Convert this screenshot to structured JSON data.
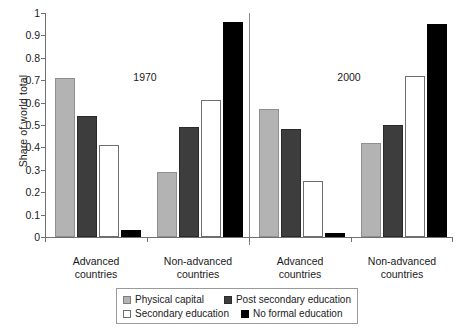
{
  "chart_data": {
    "type": "bar",
    "title": "",
    "xlabel": "",
    "ylabel": "Share of world total",
    "ylim": [
      0,
      1
    ],
    "ytick_labels": [
      "1",
      "0.9",
      "0.8",
      "0.7",
      "0.6",
      "0.5",
      "0.4",
      "0.3",
      "0.2",
      "0.1",
      "0"
    ],
    "ytick_values": [
      1,
      0.9,
      0.8,
      0.7,
      0.6,
      0.5,
      0.4,
      0.3,
      0.2,
      0.1,
      0
    ],
    "grid": false,
    "legend_position": "bottom-center",
    "panels": [
      {
        "label": "1970"
      },
      {
        "label": "2000"
      }
    ],
    "categories": [
      "Advanced countries",
      "Non-advanced countries",
      "Advanced countries",
      "Non-advanced countries"
    ],
    "series": [
      {
        "name": "Physical capital",
        "color": "#b3b3b3",
        "values": [
          0.71,
          0.29,
          0.57,
          0.42
        ]
      },
      {
        "name": "Post secondary education",
        "color": "#3d3d3d",
        "values": [
          0.54,
          0.49,
          0.48,
          0.5
        ]
      },
      {
        "name": "Secondary education",
        "color": "#ffffff",
        "values": [
          0.41,
          0.61,
          0.25,
          0.72
        ]
      },
      {
        "name": "No formal education",
        "color": "#000000",
        "values": [
          0.03,
          0.96,
          0.02,
          0.95
        ]
      }
    ]
  },
  "axis": {
    "y_title": "Share of world total",
    "ticks": [
      "1",
      "0.9",
      "0.8",
      "0.7",
      "0.6",
      "0.5",
      "0.4",
      "0.3",
      "0.2",
      "0.1",
      "0"
    ]
  },
  "panels": {
    "first": "1970",
    "second": "2000"
  },
  "groups": [
    {
      "line1": "Advanced",
      "line2": "countries"
    },
    {
      "line1": "Non-advanced",
      "line2": "countries"
    },
    {
      "line1": "Advanced",
      "line2": "countries"
    },
    {
      "line1": "Non-advanced",
      "line2": "countries"
    }
  ],
  "legend": {
    "items": [
      {
        "label": "Physical capital",
        "swatch": "physical-capital"
      },
      {
        "label": "Post secondary education",
        "swatch": "post-secondary-education"
      },
      {
        "label": "Secondary education",
        "swatch": "secondary-education"
      },
      {
        "label": "No formal education",
        "swatch": "no-formal-education"
      }
    ]
  }
}
